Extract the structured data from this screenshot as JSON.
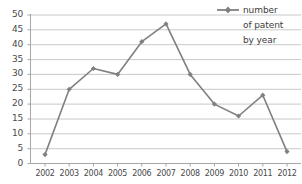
{
  "chart_data": {
    "type": "line",
    "title": "",
    "xlabel": "",
    "ylabel": "",
    "categories": [
      "2002",
      "2003",
      "2004",
      "2005",
      "2006",
      "2007",
      "2008",
      "2009",
      "2010",
      "2011",
      "2012"
    ],
    "series": [
      {
        "name": "number of patent by year",
        "values": [
          3,
          25,
          32,
          30,
          41,
          47,
          30,
          20,
          16,
          23,
          4
        ]
      }
    ],
    "ylim": [
      0,
      50
    ],
    "yticks": [
      0,
      5,
      10,
      15,
      20,
      25,
      30,
      35,
      40,
      45,
      50
    ],
    "ytick_labels": [
      "0",
      "5",
      "10",
      "15",
      "20",
      "25",
      "30",
      "35",
      "40",
      "45",
      "50"
    ],
    "grid": true,
    "grid_axis": "y",
    "legend_position": "top-right",
    "legend_lines": [
      "number",
      "of patent",
      "by year"
    ],
    "marker": "diamond",
    "colors": {
      "series": "#808080",
      "grid": "#c8c8c8",
      "axis": "#a6a6a6",
      "text": "#4a4a4a",
      "background": "#ffffff"
    }
  },
  "legend": {
    "marker_name": "line-with-diamond-marker",
    "line1": "number",
    "line2": "of patent",
    "line3": "by year"
  }
}
